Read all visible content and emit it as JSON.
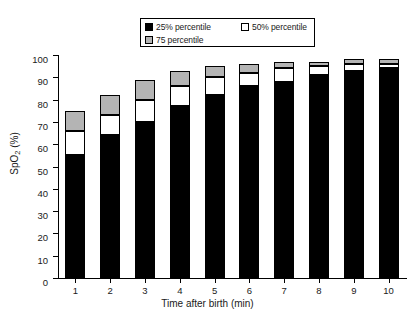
{
  "chart_data": {
    "type": "bar",
    "subtype": "stacked-percentile",
    "title": "",
    "xlabel": "Time after birth (min)",
    "ylabel": "SpO2 (%)",
    "ylabel_parts": {
      "pre": "SpO",
      "sub": "2",
      "post": " (%)"
    },
    "categories": [
      "1",
      "2",
      "3",
      "4",
      "5",
      "6",
      "7",
      "8",
      "9",
      "10"
    ],
    "ylim": [
      0,
      100
    ],
    "yticks": [
      0,
      10,
      20,
      30,
      40,
      50,
      60,
      70,
      80,
      90,
      100
    ],
    "grid": false,
    "legend_position": "top-center",
    "series": [
      {
        "name": "25% percentile",
        "color": "#000000",
        "values": [
          55,
          64,
          70,
          77,
          82,
          86,
          88,
          91,
          93,
          94
        ]
      },
      {
        "name": "50% percentile",
        "color": "#ffffff",
        "values": [
          66,
          73,
          80,
          86,
          90,
          92,
          94,
          95,
          96,
          96
        ]
      },
      {
        "name": "75 percentile",
        "color": "#b4b4b4",
        "values": [
          75,
          82,
          89,
          93,
          95,
          96,
          97,
          97,
          98,
          98
        ]
      }
    ]
  },
  "legend": {
    "entries": [
      {
        "label": "25% percentile",
        "swatch": "#000000"
      },
      {
        "label": "50% percentile",
        "swatch": "#ffffff"
      },
      {
        "label": "75 percentile",
        "swatch": "#b4b4b4"
      }
    ]
  },
  "colors": {
    "p25": "#000000",
    "p50": "#ffffff",
    "p75": "#b4b4b4",
    "axis": "#000000",
    "background": "#ffffff"
  }
}
